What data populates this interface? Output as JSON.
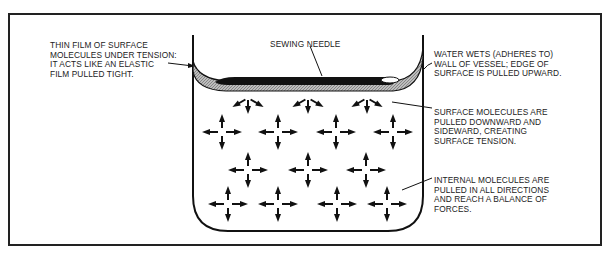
{
  "figure": {
    "type": "labeled-diagram",
    "colors": {
      "ink": "#222222",
      "film": "#a0a0a0",
      "background": "#ffffff"
    }
  },
  "labels": {
    "film": "THIN FILM OF SURFACE\nMOLECULES UNDER TENSION:\nIT ACTS LIKE AN ELASTIC\nFILM PULLED TIGHT.",
    "needle": "SEWING NEEDLE",
    "wall": "WATER WETS (ADHERES TO)\nWALL OF VESSEL; EDGE OF\nSURFACE IS PULLED UPWARD.",
    "surface_molecules": "SURFACE MOLECULES ARE\nPULLED DOWNWARD AND\nSIDEWARD, CREATING\nSURFACE TENSION.",
    "internal_molecules": "INTERNAL MOLECULES ARE\nPULLED IN ALL DIRECTIONS\nAND REACH A BALANCE OF\nFORCES."
  },
  "molecules": {
    "surface_count": 3,
    "internal_count": 11
  }
}
